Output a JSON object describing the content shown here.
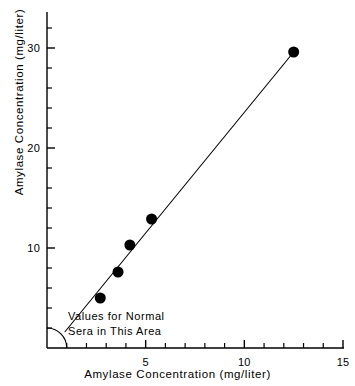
{
  "chart_data": {
    "type": "scatter",
    "title": "",
    "xlabel": "Amylase Concentration (mg/liter)",
    "ylabel": "Amylase Concentration (mg/liter)",
    "xlim": [
      0,
      15
    ],
    "ylim": [
      0,
      34
    ],
    "grid": false,
    "legend": null,
    "x_ticks_major": [
      5,
      10,
      15
    ],
    "x_tick_labels": [
      "5",
      "10",
      "15"
    ],
    "x_ticks_minor": [
      1,
      2,
      3,
      4,
      6,
      7,
      8,
      9,
      11,
      12,
      13,
      14
    ],
    "y_ticks_major": [
      10,
      20,
      30
    ],
    "y_tick_labels": [
      "10",
      "20",
      "30"
    ],
    "y_ticks_minor": [
      2,
      4,
      6,
      8,
      12,
      14,
      16,
      18,
      22,
      24,
      26,
      28,
      32
    ],
    "points": [
      {
        "x": 2.7,
        "y": 5.0
      },
      {
        "x": 3.6,
        "y": 7.6
      },
      {
        "x": 4.2,
        "y": 10.3
      },
      {
        "x": 5.3,
        "y": 12.9
      },
      {
        "x": 12.5,
        "y": 29.6
      }
    ],
    "fit_line": {
      "type": "line",
      "x_start": 0.9,
      "y_start": 1.6,
      "x_end": 12.5,
      "y_end": 29.6
    },
    "annotations": [
      {
        "text": "Values for Normal",
        "x": 1.05,
        "y": 3.3
      },
      {
        "text": "Sera in This Area",
        "x": 1.05,
        "y": 1.8
      }
    ],
    "normal_region_arc": {
      "shape": "quarter-circle",
      "center_x": 0,
      "center_y": 0,
      "radius_units_x": 1.0,
      "radius_units_y": 2.0
    },
    "colors": {
      "axis": "#000000",
      "marker": "#000000",
      "line": "#000000",
      "text": "#000000",
      "background": "#ffffff"
    },
    "marker": {
      "shape": "circle",
      "size_px": 5.5
    }
  }
}
